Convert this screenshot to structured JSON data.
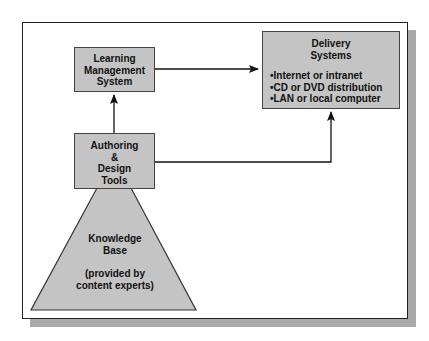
{
  "diagram": {
    "nodes": {
      "lms": {
        "lines": [
          "Learning",
          "Management",
          "System"
        ]
      },
      "authoring": {
        "lines": [
          "Authoring",
          "&",
          "Design",
          "Tools"
        ]
      },
      "delivery": {
        "title_lines": [
          "Delivery",
          "Systems"
        ],
        "items": [
          "Internet or intranet",
          "CD or DVD distribution",
          "LAN or local computer"
        ]
      },
      "knowledge_base": {
        "title_lines": [
          "Knowledge",
          "Base"
        ],
        "note_lines": [
          "(provided by",
          "content experts)"
        ]
      }
    },
    "edges": [
      {
        "from": "Authoring & Design Tools",
        "to": "Learning Management System"
      },
      {
        "from": "Learning Management System",
        "to": "Delivery Systems"
      },
      {
        "from": "Authoring & Design Tools",
        "to": "Delivery Systems"
      },
      {
        "from": "Knowledge Base",
        "to": "Authoring & Design Tools"
      }
    ],
    "colors": {
      "box_fill": "#c4c4c4",
      "border": "#222222",
      "shadow": "#a9a9a9",
      "background": "#ffffff"
    }
  }
}
